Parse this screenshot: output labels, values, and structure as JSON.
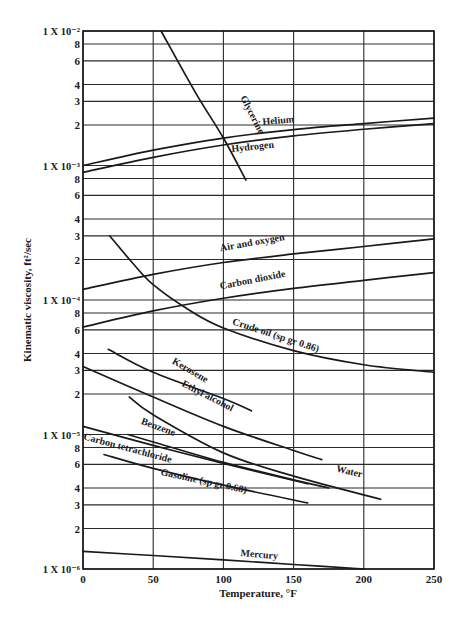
{
  "chart_data": {
    "type": "line",
    "title": "",
    "xlabel": "Temperature, °F",
    "ylabel": "Kinematic viscosity, ft²/sec",
    "xlim": [
      0,
      250
    ],
    "ylim": [
      1e-06,
      0.01
    ],
    "yscale": "log",
    "grid": true,
    "x_ticks": [
      "0",
      "50",
      "100",
      "150",
      "200",
      "250"
    ],
    "y_ticks": [
      {
        "value": 0.01,
        "label": "1 X 10⁻²"
      },
      {
        "value": 0.008,
        "label": "8"
      },
      {
        "value": 0.006,
        "label": "6"
      },
      {
        "value": 0.004,
        "label": "4"
      },
      {
        "value": 0.003,
        "label": "3"
      },
      {
        "value": 0.002,
        "label": "2"
      },
      {
        "value": 0.001,
        "label": "1 X 10⁻³"
      },
      {
        "value": 0.0008,
        "label": "8"
      },
      {
        "value": 0.0006,
        "label": "6"
      },
      {
        "value": 0.0004,
        "label": "4"
      },
      {
        "value": 0.0003,
        "label": "3"
      },
      {
        "value": 0.0002,
        "label": "2"
      },
      {
        "value": 0.0001,
        "label": "1 X 10⁻⁴"
      },
      {
        "value": 8e-05,
        "label": "8"
      },
      {
        "value": 6e-05,
        "label": "6"
      },
      {
        "value": 4e-05,
        "label": "4"
      },
      {
        "value": 3e-05,
        "label": "3"
      },
      {
        "value": 2e-05,
        "label": "2"
      },
      {
        "value": 1e-05,
        "label": "1 X 10⁻⁵"
      },
      {
        "value": 8e-06,
        "label": "8"
      },
      {
        "value": 6e-06,
        "label": "6"
      },
      {
        "value": 4e-06,
        "label": "4"
      },
      {
        "value": 3e-06,
        "label": "3"
      },
      {
        "value": 2e-06,
        "label": "2"
      },
      {
        "value": 1e-06,
        "label": "1 X 10⁻⁶"
      }
    ],
    "series": [
      {
        "name": "Glycerine",
        "points": [
          [
            55.6,
            0.01
          ],
          [
            80,
            0.0035
          ],
          [
            100,
            0.0016
          ],
          [
            116,
            0.00078
          ]
        ],
        "label_at": [
          112,
          0.0032
        ],
        "label_angle": 63
      },
      {
        "name": "Helium",
        "points": [
          [
            0,
            0.001
          ],
          [
            50,
            0.0013
          ],
          [
            100,
            0.0016
          ],
          [
            150,
            0.00185
          ],
          [
            200,
            0.00205
          ],
          [
            250,
            0.00225
          ]
        ],
        "label_at": [
          128,
          0.002
        ],
        "label_angle": -5
      },
      {
        "name": "Hydrogen",
        "points": [
          [
            0,
            0.00089
          ],
          [
            50,
            0.00115
          ],
          [
            100,
            0.00142
          ],
          [
            150,
            0.00166
          ],
          [
            200,
            0.00186
          ],
          [
            250,
            0.00205
          ]
        ],
        "label_at": [
          106,
          0.00126
        ],
        "label_angle": -6
      },
      {
        "name": "Air and oxygen",
        "points": [
          [
            0,
            0.00012
          ],
          [
            50,
            0.000155
          ],
          [
            100,
            0.00019
          ],
          [
            150,
            0.00022
          ],
          [
            200,
            0.00025
          ],
          [
            250,
            0.000285
          ]
        ],
        "label_at": [
          98,
          0.00023
        ],
        "label_angle": -10
      },
      {
        "name": "Carbon dioxide",
        "points": [
          [
            0,
            6.3e-05
          ],
          [
            50,
            8.3e-05
          ],
          [
            100,
            0.000103
          ],
          [
            150,
            0.000122
          ],
          [
            200,
            0.00014
          ],
          [
            250,
            0.00016
          ]
        ],
        "label_at": [
          98,
          0.00012
        ],
        "label_angle": -11
      },
      {
        "name": "Crude oil (sp gr 0.86)",
        "points": [
          [
            19,
            0.0003
          ],
          [
            35,
            0.00019
          ],
          [
            50,
            0.00013
          ],
          [
            75,
            8.5e-05
          ],
          [
            100,
            6.2e-05
          ],
          [
            150,
            4.2e-05
          ],
          [
            200,
            3.3e-05
          ],
          [
            250,
            2.9e-05
          ]
        ],
        "label_at": [
          106,
          6.6e-05
        ],
        "label_angle": 18
      },
      {
        "name": "Kerosene",
        "points": [
          [
            18,
            4.3e-05
          ],
          [
            50,
            2.9e-05
          ],
          [
            100,
            1.85e-05
          ],
          [
            120,
            1.5e-05
          ]
        ],
        "label_at": [
          63,
          3.4e-05
        ],
        "label_angle": 30
      },
      {
        "name": "Ethyl alcohol",
        "points": [
          [
            0,
            3.2e-05
          ],
          [
            50,
            1.9e-05
          ],
          [
            100,
            1.15e-05
          ],
          [
            150,
            7.6e-06
          ],
          [
            170,
            6.5e-06
          ]
        ],
        "label_at": [
          70,
          2.3e-05
        ],
        "label_angle": 27
      },
      {
        "name": "Water",
        "points": [
          [
            33,
            1.9e-05
          ],
          [
            50,
            1.4e-05
          ],
          [
            100,
            7.3e-06
          ],
          [
            150,
            4.9e-06
          ],
          [
            212,
            3.3e-06
          ]
        ],
        "label_at": [
          180,
          5.3e-06
        ],
        "label_angle": 13
      },
      {
        "name": "Benzene",
        "points": [
          [
            32,
            1e-05
          ],
          [
            50,
            8.8e-06
          ],
          [
            100,
            6.2e-06
          ],
          [
            150,
            4.6e-06
          ],
          [
            175,
            4e-06
          ]
        ],
        "label_at": [
          41,
          1.2e-05
        ],
        "label_angle": 20
      },
      {
        "name": "Carbon tetrachloride",
        "points": [
          [
            0,
            1.15e-05
          ],
          [
            50,
            8.3e-06
          ],
          [
            100,
            6.1e-06
          ],
          [
            160,
            4.3e-06
          ]
        ],
        "label_at": [
          0,
          9.2e-06
        ],
        "label_angle": 15
      },
      {
        "name": "Gasoline (sp gr 0.68)",
        "points": [
          [
            15,
            7.1e-06
          ],
          [
            50,
            5.6e-06
          ],
          [
            100,
            4.2e-06
          ],
          [
            160,
            3.1e-06
          ]
        ],
        "label_at": [
          55,
          5e-06
        ],
        "label_angle": 12
      },
      {
        "name": "Mercury",
        "points": [
          [
            0,
            1.35e-06
          ],
          [
            50,
            1.26e-06
          ],
          [
            100,
            1.17e-06
          ],
          [
            150,
            1.08e-06
          ],
          [
            200,
            1e-06
          ]
        ],
        "label_at": [
          112,
          1.25e-06
        ],
        "label_angle": 5
      }
    ]
  },
  "plot": {
    "left": 83,
    "right": 434,
    "top": 31,
    "bottom": 569,
    "line_color": "#1a1a1a",
    "grid_color": "#2a2a2a",
    "background": "#ffffff"
  }
}
